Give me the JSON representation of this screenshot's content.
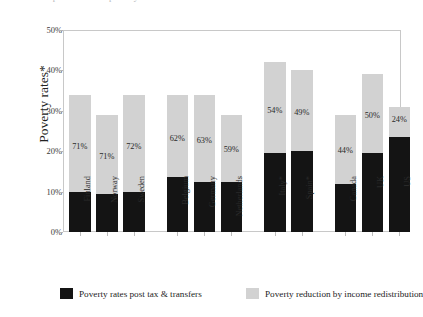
{
  "title": {
    "clipped_text": "Comparison of the poverty incidence before and after transfers and redistribution across OECD"
  },
  "chart_data": {
    "type": "bar",
    "subtype": "stacked-bar",
    "title": "",
    "xlabel": "",
    "ylabel": "Poverty rates*",
    "ylim": [
      0,
      50
    ],
    "ytick_labels": [
      "0%",
      "10%",
      "20%",
      "30%",
      "40%",
      "50%"
    ],
    "ytick_values": [
      0,
      10,
      20,
      30,
      40,
      50
    ],
    "grid": false,
    "legend_position": "bottom",
    "categories": [
      "Finland",
      "Norway",
      "Sweden",
      "Belgium",
      "Germany",
      "Netherlands",
      "Italy*",
      "Spain*",
      "Canada",
      "UK",
      "US"
    ],
    "group_breaks_after": [
      "Sweden",
      "Netherlands",
      "Spain*"
    ],
    "series": [
      {
        "name": "Poverty rates post tax & transfers",
        "color": "#141414",
        "values": [
          10.0,
          9.5,
          10.0,
          13.5,
          12.5,
          12.5,
          19.5,
          20.0,
          12.0,
          19.5,
          23.5
        ]
      },
      {
        "name": "Poverty reduction by income redistribution",
        "color": "#d2d2d2",
        "values": [
          24.0,
          19.5,
          24.0,
          20.5,
          21.5,
          16.5,
          22.5,
          20.0,
          17.0,
          19.5,
          7.5
        ]
      }
    ],
    "data_labels": [
      "71%",
      "71%",
      "72%",
      "62%",
      "63%",
      "59%",
      "54%",
      "49%",
      "44%",
      "50%",
      "24%"
    ],
    "data_label_meaning": "share of pre-transfer poverty eliminated by redistribution"
  },
  "legend": {
    "items": [
      {
        "label": "Poverty rates post tax & transfers",
        "swatch": "black"
      },
      {
        "label": "Poverty reduction by income redistribution",
        "swatch": "grey"
      }
    ]
  }
}
